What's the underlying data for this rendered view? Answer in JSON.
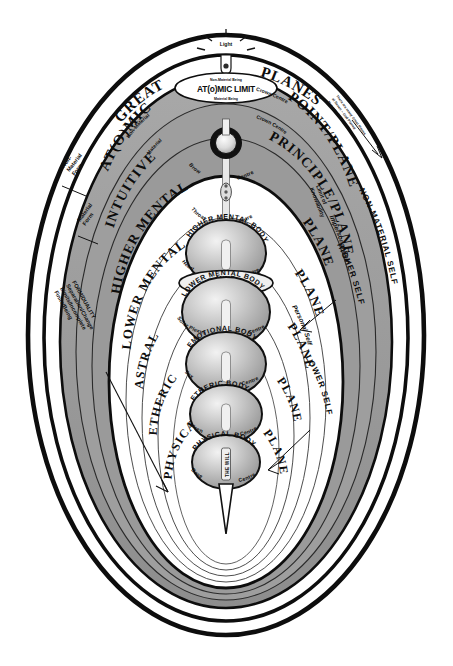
{
  "diagram": {
    "title_left": "GREAT",
    "title_right": "PLANES",
    "top_light_label": "Light",
    "atomic_limit_label": "AT(o)MIC LIMIT",
    "atomic_limit_above": "Non-Material Being",
    "atomic_limit_below": "Material Being"
  },
  "planes": [
    {
      "left": "AT(O)MIC",
      "right": "POINT/PLANE"
    },
    {
      "left": "INTUITIVE",
      "right": "PRINCIPLE/PLANE"
    },
    {
      "left": "HIGHER MENTAL",
      "right": "PLANE"
    },
    {
      "left": "LOWER MENTAL",
      "right": "PLANE"
    },
    {
      "left": "ASTRAL",
      "right": "PLANE"
    },
    {
      "left": "ETHERIC",
      "right": "PLANE"
    },
    {
      "left": "PHYSICAL",
      "right": "PLANE"
    }
  ],
  "bodies": [
    {
      "name": "HIGHER MENTAL BODY",
      "centre_left": "Heart",
      "centre_right": "Centre"
    },
    {
      "name": "LOWER MENTAL BODY",
      "centre_left": "Solar Plexus",
      "centre_right": "Centre"
    },
    {
      "name": "EMOTIONAL BODY",
      "centre_left": "Sex",
      "centre_right": "Centre"
    },
    {
      "name": "ETHERIC BODY",
      "centre_left": "Spleen",
      "centre_right": "Centre"
    },
    {
      "name": "PHYSICAL BODY",
      "centre_left": "Base",
      "centre_right": "Centre"
    }
  ],
  "upper_centres": [
    {
      "left": "Brow",
      "right": "Centre"
    },
    {
      "left": "Throat",
      "right": "Centre"
    }
  ],
  "crown": {
    "left": "Material",
    "right": "Crown Centre"
  },
  "mind_bridge": {
    "line1": "MIND",
    "line2": "BRIDGE"
  },
  "will_label": "THE WILL",
  "left_annotations": {
    "non_material_form": "Non-\nMaterial\nForm",
    "material_form": "Material\nForm",
    "form_duality": [
      "FORM/DUALITY",
      "Separation/Change",
      "Limits/Incomplete",
      "Finite/Being"
    ]
  },
  "right_annotations": {
    "non_material_self": "NON-MATERIAL SELF",
    "higher_self": "HIGHER SELF",
    "lower_self": "LOWER SELF",
    "impersonal_self": "Impersonal Self",
    "personal_self": "Personal Self",
    "limit_of_knowability": "Limit of\nKnowability",
    "note": [
      "There are many Great Planes",
      "at Seven ~ God Planed",
      "Not ~ Go back & back etc"
    ]
  },
  "top_labels": {
    "non_material_being": "Non-Material Being",
    "material_being": "Material Being",
    "non_material_left": "Non-Material",
    "crown_centre_right": "Crown Centre"
  },
  "colors": {
    "ink": "#0d0d0d",
    "grey_band": "#9b9b9b",
    "grey_band_light": "#b5b5b5",
    "grey_band_dark": "#8a8a8a",
    "paper": "#ffffff"
  }
}
